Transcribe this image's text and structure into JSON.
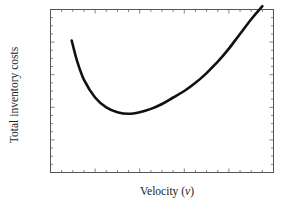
{
  "chart_data": {
    "type": "line",
    "title": "",
    "xlabel": "Velocity (v)",
    "ylabel": "Total inventory costs",
    "xlabel_text": "Velocity",
    "xlabel_symbol": "v",
    "xlim": [
      0,
      1
    ],
    "ylim": [
      0,
      1
    ],
    "grid": false,
    "legend": null,
    "x_ticks": "unlabeled; minor ticks every 1/20, major every 4 minor",
    "y_ticks": "unlabeled; minor ticks every 1/20, major every 4 minor",
    "series": [
      {
        "name": "Total inventory costs",
        "color": "#111111",
        "x": [
          0.095,
          0.12,
          0.15,
          0.2,
          0.25,
          0.3,
          0.35,
          0.4,
          0.45,
          0.5,
          0.55,
          0.6,
          0.65,
          0.7,
          0.75,
          0.8,
          0.85,
          0.9,
          0.95
        ],
        "values": [
          0.81,
          0.68,
          0.57,
          0.46,
          0.4,
          0.37,
          0.36,
          0.37,
          0.39,
          0.42,
          0.46,
          0.5,
          0.55,
          0.61,
          0.68,
          0.76,
          0.85,
          0.94,
          1.02
        ]
      }
    ],
    "annotations": [
      "U-shaped curve with minimum near v ≈ 0.35"
    ]
  },
  "colors": {
    "axis": "#555555",
    "curve": "#111111",
    "background": "#ffffff"
  }
}
